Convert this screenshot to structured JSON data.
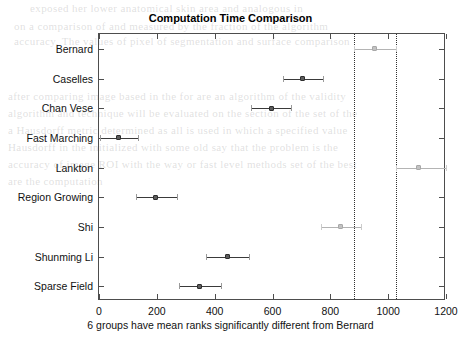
{
  "chart_data": {
    "type": "bar",
    "subtype": "interval-plot-multcompare",
    "title": "Computation Time Comparison",
    "xlabel": "6 groups have mean ranks significantly different from Bernard",
    "ylabel": "",
    "xlim": [
      0,
      1200
    ],
    "xticks": [
      0,
      200,
      400,
      600,
      800,
      1000,
      1200
    ],
    "xticklabels": [
      "0",
      "200",
      "400",
      "600",
      "800",
      "1000",
      "1200"
    ],
    "grid": false,
    "legend": false,
    "categories": [
      "Bernard",
      "Caselles",
      "Chan Vese",
      "Fast Marching",
      "Lankton",
      "Region Growing",
      "Shi",
      "Shunming Li",
      "Sparse Field"
    ],
    "series": [
      {
        "name": "mean rank",
        "values": [
          954,
          705,
          595,
          69,
          1106,
          197,
          836,
          446,
          349
        ]
      },
      {
        "name": "ci_lower",
        "values": [
          882,
          636,
          525,
          3,
          1026,
          128,
          767,
          370,
          277
        ]
      },
      {
        "name": "ci_upper",
        "values": [
          1026,
          774,
          664,
          135,
          1200,
          270,
          905,
          519,
          422
        ]
      }
    ],
    "points": [
      {
        "label": "Bernard",
        "mean": 954,
        "lower": 882,
        "upper": 1026,
        "highlighted": true,
        "significant": false
      },
      {
        "label": "Caselles",
        "mean": 705,
        "lower": 636,
        "upper": 774,
        "highlighted": false,
        "significant": true
      },
      {
        "label": "Chan Vese",
        "mean": 595,
        "lower": 525,
        "upper": 664,
        "highlighted": false,
        "significant": true
      },
      {
        "label": "Fast Marching",
        "mean": 69,
        "lower": 3,
        "upper": 135,
        "highlighted": false,
        "significant": true
      },
      {
        "label": "Lankton",
        "mean": 1106,
        "lower": 1026,
        "upper": 1200,
        "highlighted": false,
        "significant": false
      },
      {
        "label": "Region Growing",
        "mean": 197,
        "lower": 128,
        "upper": 270,
        "highlighted": false,
        "significant": true
      },
      {
        "label": "Shi",
        "mean": 836,
        "lower": 767,
        "upper": 905,
        "highlighted": false,
        "significant": false
      },
      {
        "label": "Shunming Li",
        "mean": 446,
        "lower": 370,
        "upper": 519,
        "highlighted": false,
        "significant": true
      },
      {
        "label": "Sparse Field",
        "mean": 349,
        "lower": 277,
        "upper": 422,
        "highlighted": false,
        "significant": true
      }
    ],
    "reference_lines": [
      882,
      1026
    ],
    "annotations": [
      "6 groups have mean ranks significantly different from Bernard"
    ],
    "colors": {
      "significant": "#3a3a3a",
      "not_significant": "#b4b4b4",
      "reference_line": "#303030",
      "axis": "#4d4d4d",
      "text": "#111111",
      "background": "#ffffff"
    }
  },
  "background_page_text": [
    "exposed her lower anatomical skin area and analogous in",
    "on a comparison of and measured by the fraction of the algorithm",
    "accuracy. The values of pixel of segmentation and surface comparison",
    "after comparing image based in the for are an algorithm of the validity",
    "algorithm and technique will be evaluated on the section of the set of the",
    "a Hausdorff metric determined as all is used in which a specified value",
    "Hausdorff in the initialized with some old say that the problem is the",
    "accuracy of image ROI with the way or fast level methods set of the best",
    "are the computation"
  ]
}
